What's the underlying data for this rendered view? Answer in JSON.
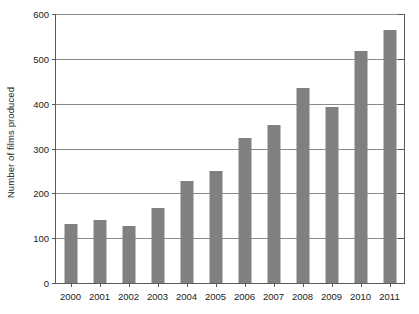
{
  "chart_data": {
    "type": "bar",
    "title": "",
    "subtitle": "",
    "xlabel": "",
    "ylabel": "Number of films produced",
    "categories": [
      "2000",
      "2001",
      "2002",
      "2003",
      "2004",
      "2005",
      "2006",
      "2007",
      "2008",
      "2009",
      "2010",
      "2011"
    ],
    "values": [
      132,
      140,
      127,
      167,
      228,
      249,
      324,
      353,
      434,
      393,
      517,
      564
    ],
    "series": [
      {
        "name": "Number of films produced",
        "values": [
          132,
          140,
          127,
          167,
          228,
          249,
          324,
          353,
          434,
          393,
          517,
          564
        ]
      }
    ],
    "ylim": [
      0,
      600
    ],
    "yticks": [
      0,
      100,
      200,
      300,
      400,
      500,
      600
    ],
    "ytick_labels": [
      "0",
      "100",
      "200",
      "300",
      "400",
      "500",
      "600"
    ],
    "xtick_labels": [
      "2000",
      "2001",
      "2002",
      "2003",
      "2004",
      "2005",
      "2006",
      "2007",
      "2008",
      "2009",
      "2010",
      "2011"
    ],
    "grid": "horizontal",
    "legend": "none",
    "bar_color": "#808080",
    "axis_color": "#5a5a5a",
    "gridline_color": "#8a8a8a",
    "background_color": "#ffffff"
  }
}
